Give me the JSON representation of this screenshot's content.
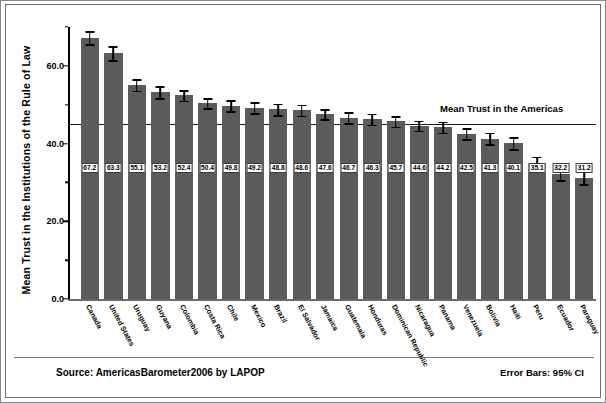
{
  "chart_data": {
    "type": "bar",
    "title": "",
    "xlabel": "",
    "ylabel": "Mean Trust in the Institutions of the Rule of Law",
    "ylim": [
      0,
      70
    ],
    "yticks": [
      "0.0",
      "20.0",
      "40.0",
      "60.0"
    ],
    "grid": false,
    "legend_position": "none",
    "categories": [
      "Canada",
      "United States",
      "Uruguay",
      "Guyana",
      "Colombia",
      "Costa Rica",
      "Chile",
      "Mexico",
      "Brazil",
      "El Salvador",
      "Jamaica",
      "Guatemala",
      "Honduras",
      "Dominican Republic",
      "Nicaragua",
      "Panama",
      "Venezuela",
      "Bolivia",
      "Haiti",
      "Peru",
      "Ecuador",
      "Paraguay"
    ],
    "values": [
      67.2,
      63.3,
      55.1,
      53.2,
      52.4,
      50.4,
      49.8,
      49.2,
      48.8,
      48.6,
      47.6,
      46.7,
      46.3,
      45.7,
      44.6,
      44.2,
      42.5,
      41.3,
      40.1,
      35.1,
      32.2,
      31.2
    ],
    "errors": [
      1.7,
      1.8,
      1.5,
      1.6,
      1.4,
      1.3,
      1.4,
      1.4,
      1.5,
      1.4,
      1.3,
      1.4,
      1.4,
      1.4,
      1.3,
      1.4,
      1.4,
      1.5,
      1.5,
      1.5,
      1.6,
      1.6
    ],
    "annotations": [
      {
        "text": "Mean Trust in the Americas",
        "value": 45.0
      }
    ],
    "reference_line": 45.0,
    "error_bar_note": "Error Bars: 95% CI",
    "source": "Source: AmericasBarometer2006 by LAPOP",
    "bar_color": "#5b5b5b",
    "error_color": "#000000",
    "reference_line_color": "#1a1a1a"
  },
  "axis": {
    "ylabel": "Mean Trust in the Institutions of the Rule of Law"
  },
  "footer": {
    "source": "Source: AmericasBarometer2006 by LAPOP",
    "error_bars": "Error Bars: 95% CI"
  },
  "reference": {
    "label": "Mean Trust in the Americas"
  }
}
